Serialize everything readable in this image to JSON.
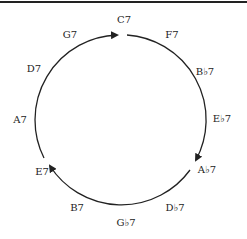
{
  "diagram": {
    "title": "",
    "labels": [
      {
        "text": "C7",
        "x": 124,
        "y": 19
      },
      {
        "text": "F7",
        "x": 172,
        "y": 34
      },
      {
        "text": "B♭7",
        "x": 205,
        "y": 71
      },
      {
        "text": "E♭7",
        "x": 222,
        "y": 118
      },
      {
        "text": "A♭7",
        "x": 207,
        "y": 169
      },
      {
        "text": "D♭7",
        "x": 175,
        "y": 207
      },
      {
        "text": "G♭7",
        "x": 126,
        "y": 222
      },
      {
        "text": "B7",
        "x": 77,
        "y": 207
      },
      {
        "text": "E7",
        "x": 42,
        "y": 171
      },
      {
        "text": "A7",
        "x": 20,
        "y": 119
      },
      {
        "text": "D7",
        "x": 34,
        "y": 68
      },
      {
        "text": "G7",
        "x": 70,
        "y": 34
      }
    ],
    "circle": {
      "cx": 121,
      "cy": 120,
      "r": 85
    },
    "arrows": [
      {
        "name": "arc-to-C7",
        "direction": "clockwise"
      },
      {
        "name": "arc-to-Ab7",
        "direction": "clockwise"
      },
      {
        "name": "arc-to-E7",
        "direction": "clockwise"
      }
    ],
    "stroke_color": "#222222"
  }
}
